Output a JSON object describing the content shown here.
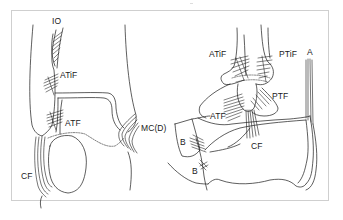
{
  "figure": {
    "colors": {
      "line": "#1a1a1a",
      "frame": "#cfcfcf",
      "background": "#ffffff"
    },
    "left_view": {
      "labels": {
        "io": "IO",
        "atif": "ATiF",
        "atf": "ATF",
        "cf": "CF",
        "mcd": "MC(D)"
      }
    },
    "right_view": {
      "labels": {
        "atif": "ATiF",
        "ptif": "PTiF",
        "a": "A",
        "ptf": "PTF",
        "atf": "ATF",
        "cf": "CF",
        "b_upper": "B",
        "b_lower": "B"
      }
    }
  }
}
